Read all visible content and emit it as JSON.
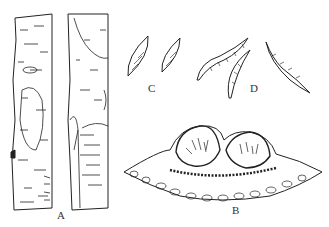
{
  "figure": {
    "type": "botanical-illustration",
    "panels": [
      {
        "id": "A",
        "label": "A",
        "description": "Two bark segments with lesions"
      },
      {
        "id": "B",
        "label": "B",
        "description": "Cross-section of two fruiting bodies (perithecia) embedded in tissue"
      },
      {
        "id": "C",
        "label": "C",
        "description": "Two fusiform spores"
      },
      {
        "id": "D",
        "label": "D",
        "description": "Three curved septate spores"
      }
    ],
    "colors": {
      "ink": "#222222",
      "background": "#ffffff"
    }
  }
}
